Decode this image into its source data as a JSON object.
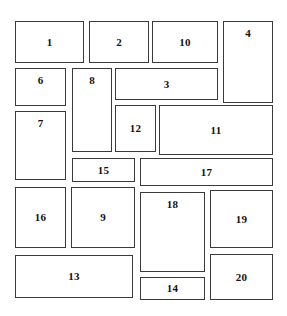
{
  "canvas": {
    "width": 287,
    "height": 316,
    "background_color": "#ffffff",
    "border_color": "#3a3a3a",
    "label_color": "#111111"
  },
  "boxes": [
    {
      "label": "1",
      "x": 15,
      "y": 21,
      "w": 69,
      "h": 42,
      "label_pos": "center"
    },
    {
      "label": "2",
      "x": 89,
      "y": 21,
      "w": 60,
      "h": 42,
      "label_pos": "center"
    },
    {
      "label": "10",
      "x": 152,
      "y": 21,
      "w": 66,
      "h": 42,
      "label_pos": "center"
    },
    {
      "label": "4",
      "x": 223,
      "y": 21,
      "w": 50,
      "h": 82,
      "label_pos": "top"
    },
    {
      "label": "6",
      "x": 15,
      "y": 68,
      "w": 51,
      "h": 38,
      "label_pos": "top"
    },
    {
      "label": "8",
      "x": 72,
      "y": 68,
      "w": 40,
      "h": 84,
      "label_pos": "top"
    },
    {
      "label": "3",
      "x": 115,
      "y": 68,
      "w": 103,
      "h": 32,
      "label_pos": "center"
    },
    {
      "label": "7",
      "x": 15,
      "y": 111,
      "w": 51,
      "h": 69,
      "label_pos": "top"
    },
    {
      "label": "12",
      "x": 115,
      "y": 105,
      "w": 41,
      "h": 47,
      "label_pos": "center"
    },
    {
      "label": "11",
      "x": 159,
      "y": 105,
      "w": 114,
      "h": 50,
      "label_pos": "center"
    },
    {
      "label": "15",
      "x": 72,
      "y": 158,
      "w": 63,
      "h": 24,
      "label_pos": "center"
    },
    {
      "label": "17",
      "x": 140,
      "y": 158,
      "w": 133,
      "h": 28,
      "label_pos": "center"
    },
    {
      "label": "16",
      "x": 15,
      "y": 187,
      "w": 51,
      "h": 61,
      "label_pos": "center"
    },
    {
      "label": "9",
      "x": 71,
      "y": 187,
      "w": 64,
      "h": 61,
      "label_pos": "center"
    },
    {
      "label": "18",
      "x": 140,
      "y": 192,
      "w": 65,
      "h": 80,
      "label_pos": "top"
    },
    {
      "label": "19",
      "x": 210,
      "y": 190,
      "w": 63,
      "h": 58,
      "label_pos": "center"
    },
    {
      "label": "13",
      "x": 15,
      "y": 255,
      "w": 118,
      "h": 43,
      "label_pos": "center"
    },
    {
      "label": "20",
      "x": 210,
      "y": 254,
      "w": 63,
      "h": 46,
      "label_pos": "center"
    },
    {
      "label": "14",
      "x": 140,
      "y": 277,
      "w": 65,
      "h": 23,
      "label_pos": "center"
    }
  ]
}
